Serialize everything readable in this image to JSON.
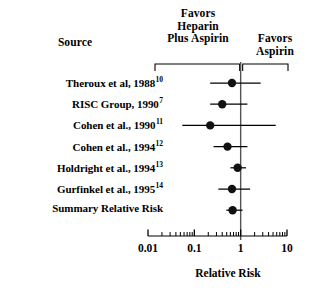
{
  "figure": {
    "source_header": "Source",
    "favors_left_header": "Favors\nHeparin\nPlus Aspirin",
    "favors_left_line1": "Favors",
    "favors_left_line2": "Heparin",
    "favors_left_line3": "Plus Aspirin",
    "favors_right_line1": "Favors",
    "favors_right_line2": "Aspirin",
    "axis_title": "Relative Risk"
  },
  "chart_data": {
    "type": "forest",
    "title": "",
    "xlabel": "Relative Risk",
    "ylabel": "Source",
    "xscale": "log",
    "xlim": [
      0.01,
      10
    ],
    "tick_labels": [
      "0.01",
      "0.1",
      "1",
      "10"
    ],
    "tick_values": [
      0.01,
      0.1,
      1,
      10
    ],
    "minor_ticks": true,
    "grid": false,
    "reference_line": 1,
    "legend_position": "top",
    "annotations": [
      "Favors Heparin Plus Aspirin",
      "Favors Aspirin"
    ],
    "columns": [
      "Source",
      "Relative Risk",
      "Lower 95% CI",
      "Upper 95% CI"
    ],
    "rows": [
      {
        "source": "Theroux et al, 1988",
        "ref": "10",
        "estimate": 0.65,
        "ci_low": 0.22,
        "ci_high": 2.7,
        "summary": false
      },
      {
        "source": "RISC Group, 1990",
        "ref": "7",
        "estimate": 0.4,
        "ci_low": 0.22,
        "ci_high": 1.4,
        "summary": false
      },
      {
        "source": "Cohen et al., 1990",
        "ref": "11",
        "estimate": 0.22,
        "ci_low": 0.055,
        "ci_high": 5.7,
        "summary": false
      },
      {
        "source": "Cohen et al., 1994",
        "ref": "12",
        "estimate": 0.52,
        "ci_low": 0.26,
        "ci_high": 1.4,
        "summary": false
      },
      {
        "source": "Holdright et al., 1994",
        "ref": "13",
        "estimate": 0.86,
        "ci_low": 0.6,
        "ci_high": 1.3,
        "summary": false
      },
      {
        "source": "Gurfinkel et al., 1995",
        "ref": "14",
        "estimate": 0.65,
        "ci_low": 0.33,
        "ci_high": 1.6,
        "summary": false
      },
      {
        "source": "Summary Relative Risk",
        "ref": "",
        "estimate": 0.67,
        "ci_low": 0.49,
        "ci_high": 1.1,
        "summary": true
      }
    ]
  },
  "style": {
    "ink": "#000000",
    "marker": "#111111",
    "rule": "#555555",
    "background": "#ffffff"
  }
}
